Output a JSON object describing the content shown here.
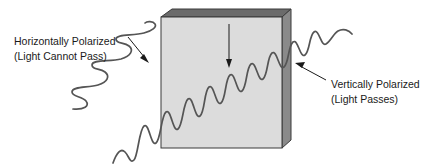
{
  "figure": {
    "background_color": "#ffffff"
  },
  "labels": {
    "left": {
      "line1": "Horizontally Polarized",
      "line2": "(Light Cannot Pass)"
    },
    "right": {
      "line1": "Vertically Polarized",
      "line2": "(Light Passes)"
    }
  },
  "filter": {
    "name": "polarizing-filter-slab",
    "front_face_color": "#dcdcdc",
    "top_face_color": "#6b6b6b",
    "side_face_color": "#8a8a8a",
    "outline_color": "#3a3a3a"
  },
  "waves": {
    "incoming": {
      "name": "horizontally-polarized-wave",
      "color": "#555555",
      "polarization": "horizontal",
      "description": "Zigzag wave approaching filter from lower left, blocked at surface"
    },
    "transmitted": {
      "name": "vertically-polarized-wave",
      "color": "#555555",
      "polarization": "vertical",
      "description": "Sine wave passing through the filter and exiting upper right"
    }
  },
  "arrows": {
    "axis": {
      "name": "filter-axis-arrow",
      "color": "#1a1a1a",
      "direction": "down"
    },
    "left_leader": {
      "name": "left-label-leader-arrow",
      "color": "#1a1a1a"
    },
    "right_leader": {
      "name": "right-label-leader-arrow",
      "color": "#1a1a1a"
    }
  }
}
